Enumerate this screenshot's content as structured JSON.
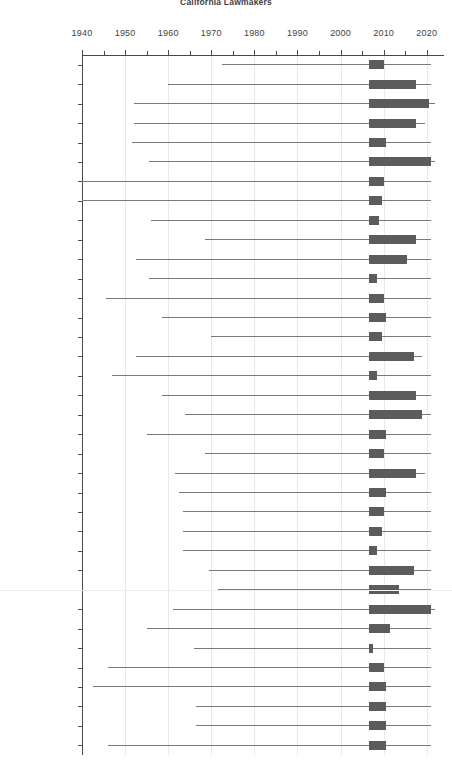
{
  "title": "California Lawmakers",
  "chart_data": {
    "type": "bar",
    "subtype": "box-and-whisker timeline",
    "title": "California Lawmakers",
    "xlabel": "",
    "ylabel": "",
    "xlim": [
      1940,
      2024
    ],
    "xticks": [
      1940,
      1950,
      1960,
      1970,
      1980,
      1990,
      2000,
      2010,
      2020
    ],
    "xtick_labels": [
      "1940",
      "1950",
      "1960",
      "1970",
      "1980",
      "1990",
      "2000",
      "2010",
      "2020"
    ],
    "minor_tick_step": 5,
    "grid": "vertical-decades",
    "legend": "none",
    "box_color": "#5c5c5c",
    "whisker_color": "#7a7a7a",
    "grid_color": "#e9e9e9",
    "axis_color": "#4a4a4a",
    "categories": [
      "ADAMS",
      "ANDERSON",
      "BEALL",
      "BERRYHILL",
      "BROWNLEY",
      "CABALLERO",
      "CARTER",
      "COOK",
      "DAVIS",
      "DE LEÓN",
      "DESAULNIER",
      "DUVALL",
      "ENG",
      "FEUER",
      "FUENTES",
      "FULLER",
      "FURUTANI",
      "GAINES",
      "GALGIANI",
      "GARRICK",
      "HAYASHI",
      "HERNANDEZ",
      "HUFFMAN",
      "JEFFRIES",
      "KREKORIAN",
      "MA",
      "MENDOZA",
      "PADILLA",
      "PORTANTINO",
      "PRICE JR.",
      "RICHARDSON",
      "SALAS",
      "SILVA",
      "SMYTH",
      "SOLORIO",
      "SWANSON"
    ],
    "rows": [
      {
        "name": "ADAMS",
        "whisker_min": 1972.5,
        "q1": 2006.5,
        "q3": 2010.0,
        "whisker_max": 2021.0
      },
      {
        "name": "ANDERSON",
        "whisker_min": 1960.0,
        "q1": 2006.5,
        "q3": 2017.5,
        "whisker_max": 2021.0
      },
      {
        "name": "BEALL",
        "whisker_min": 1952.0,
        "q1": 2006.5,
        "q3": 2020.5,
        "whisker_max": 2022.0
      },
      {
        "name": "BERRYHILL",
        "whisker_min": 1952.0,
        "q1": 2006.5,
        "q3": 2017.5,
        "whisker_max": 2019.5
      },
      {
        "name": "BROWNLEY",
        "whisker_min": 1951.5,
        "q1": 2006.5,
        "q3": 2010.5,
        "whisker_max": 2021.0
      },
      {
        "name": "CABALLERO",
        "whisker_min": 1955.5,
        "q1": 2006.5,
        "q3": 2021.0,
        "whisker_max": 2022.0
      },
      {
        "name": "CARTER",
        "whisker_min": 1940.0,
        "q1": 2006.5,
        "q3": 2010.0,
        "whisker_max": 2021.0
      },
      {
        "name": "COOK",
        "whisker_min": 1940.0,
        "q1": 2006.5,
        "q3": 2009.5,
        "whisker_max": 2021.0
      },
      {
        "name": "DAVIS",
        "whisker_min": 1956.0,
        "q1": 2006.5,
        "q3": 2009.0,
        "whisker_max": 2021.0
      },
      {
        "name": "DE LEÓN",
        "whisker_min": 1968.5,
        "q1": 2006.5,
        "q3": 2017.5,
        "whisker_max": 2021.0
      },
      {
        "name": "DESAULNIER",
        "whisker_min": 1952.5,
        "q1": 2006.5,
        "q3": 2015.5,
        "whisker_max": 2021.0
      },
      {
        "name": "DUVALL",
        "whisker_min": 1955.5,
        "q1": 2006.5,
        "q3": 2008.5,
        "whisker_max": 2021.0
      },
      {
        "name": "ENG",
        "whisker_min": 1945.5,
        "q1": 2006.5,
        "q3": 2010.0,
        "whisker_max": 2021.0
      },
      {
        "name": "FEUER",
        "whisker_min": 1958.5,
        "q1": 2006.5,
        "q3": 2010.5,
        "whisker_max": 2021.0
      },
      {
        "name": "FUENTES",
        "whisker_min": 1970.0,
        "q1": 2006.5,
        "q3": 2009.5,
        "whisker_max": 2021.0
      },
      {
        "name": "FULLER",
        "whisker_min": 1952.5,
        "q1": 2006.5,
        "q3": 2017.0,
        "whisker_max": 2019.0
      },
      {
        "name": "FURUTANI",
        "whisker_min": 1947.0,
        "q1": 2006.5,
        "q3": 2008.5,
        "whisker_max": 2021.0
      },
      {
        "name": "GAINES",
        "whisker_min": 1958.5,
        "q1": 2006.5,
        "q3": 2017.5,
        "whisker_max": 2021.0
      },
      {
        "name": "GALGIANI",
        "whisker_min": 1964.0,
        "q1": 2006.5,
        "q3": 2019.0,
        "whisker_max": 2021.0
      },
      {
        "name": "GARRICK",
        "whisker_min": 1955.0,
        "q1": 2006.5,
        "q3": 2010.5,
        "whisker_max": 2021.0
      },
      {
        "name": "HAYASHI",
        "whisker_min": 1968.5,
        "q1": 2006.5,
        "q3": 2010.0,
        "whisker_max": 2021.0
      },
      {
        "name": "HERNANDEZ",
        "whisker_min": 1961.5,
        "q1": 2006.5,
        "q3": 2017.5,
        "whisker_max": 2019.5
      },
      {
        "name": "HUFFMAN",
        "whisker_min": 1962.5,
        "q1": 2006.5,
        "q3": 2010.5,
        "whisker_max": 2021.0
      },
      {
        "name": "JEFFRIES",
        "whisker_min": 1963.5,
        "q1": 2006.5,
        "q3": 2010.0,
        "whisker_max": 2021.0
      },
      {
        "name": "KREKORIAN",
        "whisker_min": 1963.5,
        "q1": 2006.5,
        "q3": 2009.5,
        "whisker_max": 2021.0
      },
      {
        "name": "MA",
        "whisker_min": 1963.5,
        "q1": 2006.5,
        "q3": 2008.5,
        "whisker_max": 2021.0
      },
      {
        "name": "MENDOZA",
        "whisker_min": 1969.5,
        "q1": 2006.5,
        "q3": 2017.0,
        "whisker_max": 2021.0
      },
      {
        "name": "PADILLA",
        "whisker_min": 1971.5,
        "q1": 2006.5,
        "q3": 2013.5,
        "whisker_max": 2021.0
      },
      {
        "name": "PORTANTINO",
        "whisker_min": 1961.0,
        "q1": 2006.5,
        "q3": 2021.0,
        "whisker_max": 2022.0
      },
      {
        "name": "PRICE JR.",
        "whisker_min": 1955.0,
        "q1": 2006.5,
        "q3": 2011.5,
        "whisker_max": 2021.0
      },
      {
        "name": "RICHARDSON",
        "whisker_min": 1966.0,
        "q1": 2006.5,
        "q3": 2007.5,
        "whisker_max": 2021.0
      },
      {
        "name": "SALAS",
        "whisker_min": 1946.0,
        "q1": 2006.5,
        "q3": 2010.0,
        "whisker_max": 2021.0
      },
      {
        "name": "SILVA",
        "whisker_min": 1942.5,
        "q1": 2006.5,
        "q3": 2010.5,
        "whisker_max": 2021.0
      },
      {
        "name": "SMYTH",
        "whisker_min": 1966.5,
        "q1": 2006.5,
        "q3": 2010.5,
        "whisker_max": 2021.0
      },
      {
        "name": "SOLORIO",
        "whisker_min": 1966.5,
        "q1": 2006.5,
        "q3": 2010.5,
        "whisker_max": 2021.0
      },
      {
        "name": "SWANSON",
        "whisker_min": 1946.0,
        "q1": 2006.5,
        "q3": 2010.5,
        "whisker_max": 2021.0
      }
    ]
  }
}
